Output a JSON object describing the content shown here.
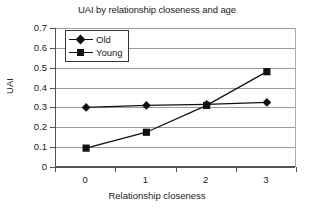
{
  "chart_data": {
    "type": "line",
    "title": "UAI by relationship closeness and age",
    "xlabel": "Relationship closeness",
    "ylabel": "UAI",
    "categories": [
      "0",
      "1",
      "2",
      "3"
    ],
    "x": [
      0,
      1,
      2,
      3
    ],
    "series": [
      {
        "name": "Old",
        "marker": "diamond",
        "color": "#111111",
        "values": [
          0.3,
          0.31,
          0.315,
          0.325
        ]
      },
      {
        "name": "Young",
        "marker": "square",
        "color": "#111111",
        "values": [
          0.095,
          0.175,
          0.31,
          0.48
        ]
      }
    ],
    "ylim": [
      0,
      0.7
    ],
    "ytick_step": 0.1,
    "ytick_labels": [
      "0.7",
      "0.6",
      "0.5",
      "0.4",
      "0.3",
      "0.2",
      "0.1",
      "0"
    ],
    "ytick_values": [
      0.7,
      0.6,
      0.5,
      0.4,
      0.3,
      0.2,
      0.1,
      0
    ],
    "xtick_labels": [
      "0",
      "1",
      "2",
      "3"
    ],
    "grid": "horizontal",
    "legend_position": "top-left-inside",
    "legend_entries": [
      "Old",
      "Young"
    ],
    "plot_background": "#ffffff",
    "gridline_color": "#9a9a9a",
    "axis_color": "#555555"
  }
}
